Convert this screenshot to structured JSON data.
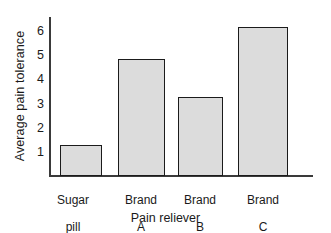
{
  "chart_data": {
    "type": "bar",
    "title": "",
    "categories": [
      "Sugar pill",
      "Brand A",
      "Brand B",
      "Brand C"
    ],
    "category_lines": [
      [
        "Sugar",
        "pill"
      ],
      [
        "Brand",
        "A"
      ],
      [
        "Brand",
        "B"
      ],
      [
        "Brand",
        "C"
      ]
    ],
    "values": [
      1.35,
      5.1,
      3.45,
      6.5
    ],
    "xlabel": "Pain reliever",
    "ylabel": "Average pain tolerance",
    "ylim": [
      0,
      6.9
    ],
    "yticks": [
      1,
      2,
      3,
      4,
      5,
      6
    ],
    "ytick_labels": [
      "1",
      "2",
      "3",
      "4",
      "5",
      "6"
    ],
    "grid": false,
    "legend": false,
    "bar_fill_color": "#dcdcdc",
    "bar_edge_color": "#1b1b1b",
    "axis_color": "#3a3a3a",
    "background_color": "#ffffff"
  }
}
